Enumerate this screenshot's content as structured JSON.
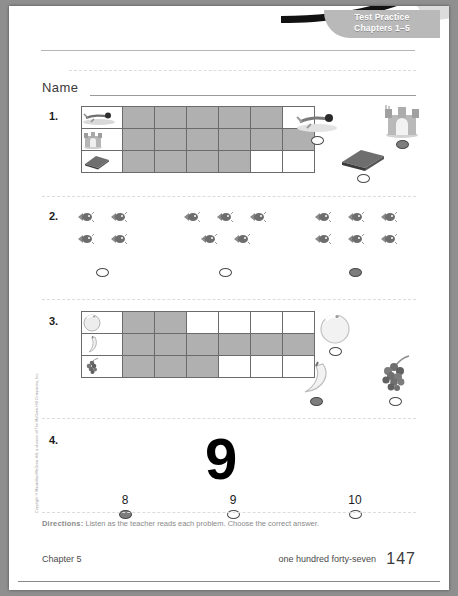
{
  "header": {
    "banner_line1": "Test Practice",
    "banner_line2": "Chapters 1–5"
  },
  "name_field": {
    "label": "Name",
    "value": "",
    "placeholder": ""
  },
  "problems": [
    {
      "number": "1.",
      "type": "pictograph",
      "columns": 6,
      "rows": [
        {
          "icon": "swimmer-icon",
          "label": "swimming",
          "filled": 5
        },
        {
          "icon": "sandcastle-icon",
          "label": "sandcastle",
          "filled": 6
        },
        {
          "icon": "book-icon",
          "label": "book",
          "filled": 4
        }
      ],
      "choices": [
        {
          "icon": "swimmer-icon",
          "label": "swimming",
          "selected": false
        },
        {
          "icon": "sandcastle-icon",
          "label": "sandcastle",
          "selected": true
        },
        {
          "icon": "book-icon",
          "label": "book",
          "selected": false
        }
      ]
    },
    {
      "number": "2.",
      "type": "counting-groups",
      "groups": [
        {
          "count": 4,
          "top_row": 2,
          "bottom_row": 2,
          "selected": false
        },
        {
          "count": 5,
          "top_row": 3,
          "bottom_row": 2,
          "selected": false
        },
        {
          "count": 6,
          "top_row": 3,
          "bottom_row": 3,
          "selected": true
        }
      ],
      "icon": "fish-icon"
    },
    {
      "number": "3.",
      "type": "pictograph",
      "columns": 6,
      "rows": [
        {
          "icon": "orange-icon",
          "label": "orange",
          "filled": 2
        },
        {
          "icon": "banana-icon",
          "label": "banana",
          "filled": 6
        },
        {
          "icon": "grapes-icon",
          "label": "grapes",
          "filled": 3
        }
      ],
      "choices": [
        {
          "icon": "orange-icon",
          "label": "orange",
          "selected": false
        },
        {
          "icon": "banana-icon",
          "label": "banana",
          "selected": true
        },
        {
          "icon": "grapes-icon",
          "label": "grapes",
          "selected": false
        }
      ]
    },
    {
      "number": "4.",
      "type": "numeral-choice",
      "numeral": "9",
      "choices": [
        {
          "label": "8",
          "selected": true
        },
        {
          "label": "9",
          "selected": false
        },
        {
          "label": "10",
          "selected": false
        }
      ]
    }
  ],
  "directions": {
    "prefix": "Directions:",
    "text": "Listen as the teacher reads each problem. Choose the correct answer."
  },
  "footer": {
    "chapter": "Chapter 5",
    "page_words": "one hundred forty-seven",
    "page_number": "147"
  },
  "copyright": "Copyright © Macmillan/McGraw-Hill, a division of The McGraw-Hill Companies, Inc."
}
